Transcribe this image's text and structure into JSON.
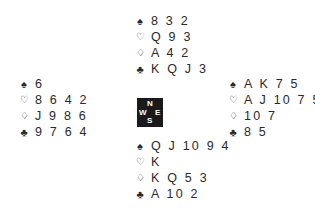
{
  "diagram": {
    "type": "bridge-deal",
    "suit_symbols": {
      "spades": "♠",
      "hearts": "♡",
      "diamonds": "♢",
      "clubs": "♣"
    },
    "compass": {
      "north": "N",
      "south": "S",
      "west": "W",
      "east": "E"
    },
    "hands": {
      "north": {
        "spades": "8 3 2",
        "hearts": "Q 9 3",
        "diamonds": "A 4 2",
        "clubs": "K Q J 3"
      },
      "west": {
        "spades": "6",
        "hearts": "8 6 4 2",
        "diamonds": "J 9 8 6",
        "clubs": "9 7 6 4"
      },
      "east": {
        "spades": "A K 7 5",
        "hearts": "A J 10 7 5",
        "diamonds": "10 7",
        "clubs": "8 5"
      },
      "south": {
        "spades": "Q J 10 9 4",
        "hearts": "K",
        "diamonds": "K Q 5 3",
        "clubs": "A 10 2"
      }
    }
  }
}
